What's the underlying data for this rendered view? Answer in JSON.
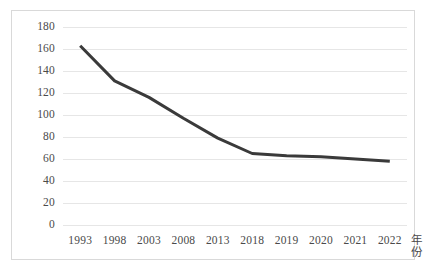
{
  "chart_data": {
    "type": "line",
    "title": "",
    "subtitle": "",
    "xlabel": "年份",
    "ylabel": "",
    "categories": [
      "1993",
      "1998",
      "2003",
      "2008",
      "2013",
      "2018",
      "2019",
      "2020",
      "2021",
      "2022"
    ],
    "values": [
      163,
      131,
      116,
      97,
      79,
      65,
      63,
      62,
      60,
      58
    ],
    "series": [
      {
        "name": "",
        "values": [
          163,
          131,
          116,
          97,
          79,
          65,
          63,
          62,
          60,
          58
        ],
        "color": "#3a3a3a",
        "line_width": 3,
        "markers": false
      }
    ],
    "ylim": [
      0,
      180
    ],
    "yticks": [
      0,
      20,
      40,
      60,
      80,
      100,
      120,
      140,
      160,
      180
    ],
    "ytick_labels": [
      "0",
      "20",
      "40",
      "60",
      "80",
      "100",
      "120",
      "140",
      "160",
      "180"
    ],
    "grid": {
      "horizontal": true,
      "vertical": false,
      "color": "#e6e6e6"
    },
    "legend": {
      "visible": false,
      "position": "none",
      "entries": []
    },
    "plot_border": {
      "visible": true,
      "color": "#d9d9d9"
    },
    "background_color": "#ffffff",
    "annotations": []
  },
  "axis": {
    "x_title": "年份"
  }
}
